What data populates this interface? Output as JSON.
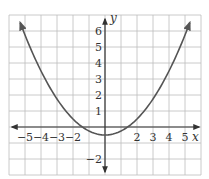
{
  "chart_data": {
    "type": "line",
    "title": "",
    "xlabel": "x",
    "ylabel": "y",
    "xlim": [
      -6,
      6
    ],
    "ylim": [
      -3,
      7
    ],
    "grid": true,
    "x_tick_labels": [
      "-5",
      "-4",
      "-3",
      "-2",
      "2",
      "3",
      "4",
      "5"
    ],
    "y_tick_labels": [
      "6",
      "5",
      "4",
      "3",
      "2",
      "1",
      "-2"
    ],
    "series": [
      {
        "name": "parabola",
        "equation": "y = 0.25x^2 - 0.5",
        "vertex": [
          0,
          -0.5
        ],
        "x_intercepts": [
          -1.41,
          1.41
        ],
        "x": [
          -5.3,
          -5,
          -4,
          -3,
          -2,
          -1.41,
          -1,
          0,
          1,
          1.41,
          2,
          3,
          4,
          5,
          5.3
        ],
        "y": [
          6.52,
          5.75,
          3.5,
          1.75,
          0.5,
          0,
          -0.25,
          -0.5,
          -0.25,
          0,
          0.5,
          1.75,
          3.5,
          5.75,
          6.52
        ],
        "arrows_at_ends": true
      }
    ],
    "colors": {
      "grid": "#bdbdbd",
      "axes": "#333333",
      "curve": "#555555",
      "background": "#ffffff"
    }
  },
  "labels": {
    "x_axis": "x",
    "y_axis": "y",
    "x_ticks": [
      {
        "value": -5,
        "text": "−5"
      },
      {
        "value": -4,
        "text": "−4"
      },
      {
        "value": -3,
        "text": "−3"
      },
      {
        "value": -2,
        "text": "−2"
      },
      {
        "value": 2,
        "text": "2"
      },
      {
        "value": 3,
        "text": "3"
      },
      {
        "value": 4,
        "text": "4"
      },
      {
        "value": 5,
        "text": "5"
      }
    ],
    "y_ticks": [
      {
        "value": 6,
        "text": "6"
      },
      {
        "value": 5,
        "text": "5"
      },
      {
        "value": 4,
        "text": "4"
      },
      {
        "value": 3,
        "text": "3"
      },
      {
        "value": 2,
        "text": "2"
      },
      {
        "value": 1,
        "text": "1"
      },
      {
        "value": -2,
        "text": "−2"
      }
    ]
  }
}
